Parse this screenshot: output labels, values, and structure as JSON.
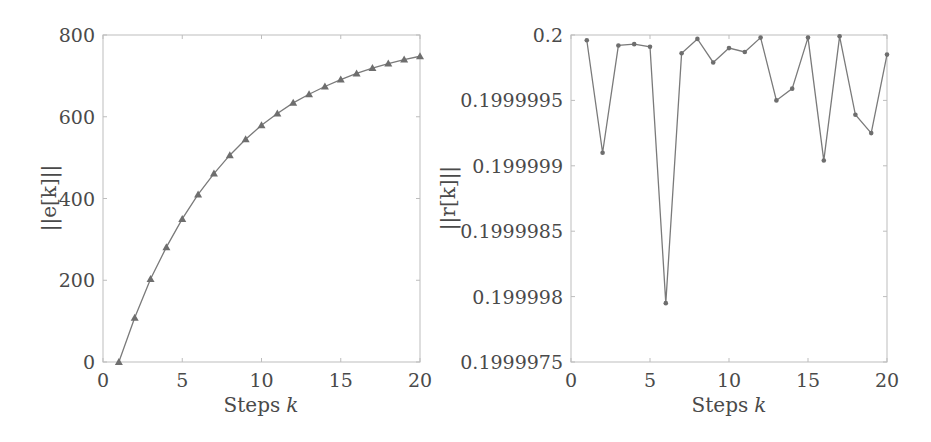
{
  "figure": {
    "line_color": "#7a7a7a",
    "marker_color": "#6e6e6e",
    "frame_color": "#bdbdbd",
    "text_color": "#4a4a4a"
  },
  "chart_data": [
    {
      "type": "line",
      "title": "",
      "xlabel": "Steps k",
      "xlabel_text": "Steps",
      "xlabel_var": "k",
      "ylabel": "||e[k]||",
      "xlim": [
        0,
        20
      ],
      "ylim": [
        0,
        800
      ],
      "xticks": [
        0,
        5,
        10,
        15,
        20
      ],
      "xtick_labels": [
        "0",
        "5",
        "10",
        "15",
        "20"
      ],
      "yticks": [
        0,
        200,
        400,
        600,
        800
      ],
      "ytick_labels": [
        "0",
        "200",
        "400",
        "600",
        "800"
      ],
      "grid": false,
      "marker": "triangle",
      "series": [
        {
          "name": "||e[k]||",
          "x": [
            1,
            2,
            3,
            4,
            5,
            6,
            7,
            8,
            9,
            10,
            11,
            12,
            13,
            14,
            15,
            16,
            17,
            18,
            19,
            20
          ],
          "values": [
            0,
            108,
            203,
            281,
            350,
            410,
            461,
            506,
            545,
            579,
            608,
            634,
            655,
            674,
            691,
            706,
            719,
            730,
            740,
            748
          ]
        }
      ]
    },
    {
      "type": "line",
      "title": "",
      "xlabel": "Steps k",
      "xlabel_text": "Steps",
      "xlabel_var": "k",
      "ylabel": "||r[k]||",
      "xlim": [
        0,
        20
      ],
      "ylim": [
        0.1999975,
        0.2
      ],
      "xticks": [
        0,
        5,
        10,
        15,
        20
      ],
      "xtick_labels": [
        "0",
        "5",
        "10",
        "15",
        "20"
      ],
      "yticks": [
        0.1999975,
        0.199998,
        0.1999985,
        0.199999,
        0.1999995,
        0.2
      ],
      "ytick_labels": [
        "0.1999975",
        "0.199998",
        "0.1999985",
        "0.199999",
        "0.1999995",
        "0.2"
      ],
      "grid": false,
      "marker": "dot",
      "series": [
        {
          "name": "||r[k]||",
          "x": [
            1,
            2,
            3,
            4,
            5,
            6,
            7,
            8,
            9,
            10,
            11,
            12,
            13,
            14,
            15,
            16,
            17,
            18,
            19,
            20
          ],
          "values": [
            0.19999996,
            0.1999991,
            0.19999992,
            0.19999993,
            0.19999991,
            0.19999795,
            0.19999986,
            0.19999997,
            0.19999979,
            0.1999999,
            0.19999987,
            0.19999998,
            0.1999995,
            0.19999959,
            0.19999998,
            0.19999904,
            0.19999999,
            0.19999939,
            0.19999925,
            0.19999985
          ]
        }
      ]
    }
  ]
}
